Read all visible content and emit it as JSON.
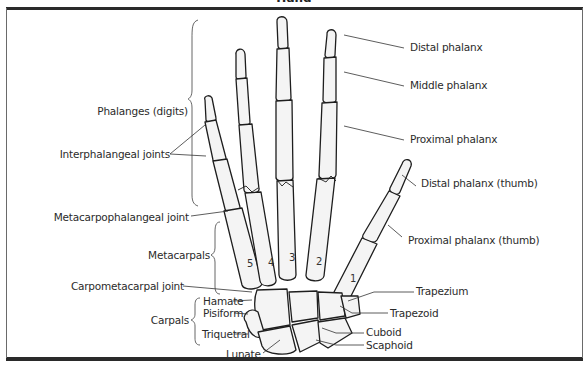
{
  "title": "Hand",
  "labels_right": {
    "distal_phalanx": "Distal phalanx",
    "middle_phalanx": "Middle phalanx",
    "proximal_phalanx": "Proximal phalanx",
    "distal_phalanx_thumb": "Distal phalanx (thumb)",
    "proximal_phalanx_thumb": "Proximal phalanx (thumb)",
    "trapezium": "Trapezium",
    "trapezoid": "Trapezoid",
    "cuboid": "Cuboid",
    "scaphoid": "Scaphoid"
  },
  "labels_left": {
    "phalanges": "Phalanges (digits)",
    "interphalangeal_joints": "Interphalangeal joints",
    "metacarpophalangeal_joint": "Metacarpophalangeal joint",
    "metacarpals": "Metacarpals",
    "carpometacarpal_joint": "Carpometacarpal joint",
    "carpals": "Carpals",
    "hamate": "Hamate",
    "pisiform": "Pisiform",
    "triquetral": "Triquetral",
    "lunate": "Lunate"
  },
  "metacarpal_numbers": [
    "5",
    "4",
    "3",
    "2",
    "1"
  ]
}
